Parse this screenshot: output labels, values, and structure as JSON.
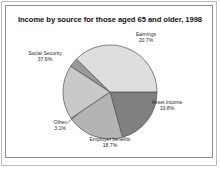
{
  "chart_data": {
    "type": "pie",
    "title": "Income by source for those aged 65 and older, 1998",
    "xlabel": "",
    "ylabel": "",
    "legend_position": "none",
    "grid": false,
    "labels_outside": true,
    "categories": [
      "Earnings",
      "Asset income",
      "Employer benefits",
      "Other",
      "Social Security"
    ],
    "values": [
      20.7,
      19.8,
      18.7,
      3.1,
      37.6
    ],
    "unit": "%",
    "slices": [
      {
        "name": "Earnings",
        "label": "Earnings",
        "value": 20.7,
        "value_label": "20.7%",
        "color": "#808080",
        "start_angle_deg": 0,
        "end_angle_deg": 74.52
      },
      {
        "name": "Asset income",
        "label": "Asset income",
        "value": 19.8,
        "value_label": "19.8%",
        "color": "#b4b4b4",
        "start_angle_deg": 74.52,
        "end_angle_deg": 145.8
      },
      {
        "name": "Employer benefits",
        "label": "Employer benefits",
        "value": 18.7,
        "value_label": "18.7%",
        "color": "#c9c9c9",
        "start_angle_deg": 145.8,
        "end_angle_deg": 213.12
      },
      {
        "name": "Other",
        "label": "Other",
        "value": 3.1,
        "value_label": "3.1%",
        "color": "#9a9a9a",
        "start_angle_deg": 213.12,
        "end_angle_deg": 224.28
      },
      {
        "name": "Social Security",
        "label": "Social Security",
        "value": 37.6,
        "value_label": "37.6%",
        "color": "#dedede",
        "start_angle_deg": 224.28,
        "end_angle_deg": 359.64
      }
    ],
    "slice_outline_color": "#4d4d4d",
    "background_color": "#ffffff",
    "title_color": "#111111",
    "label_color": "#2a2a2a"
  }
}
